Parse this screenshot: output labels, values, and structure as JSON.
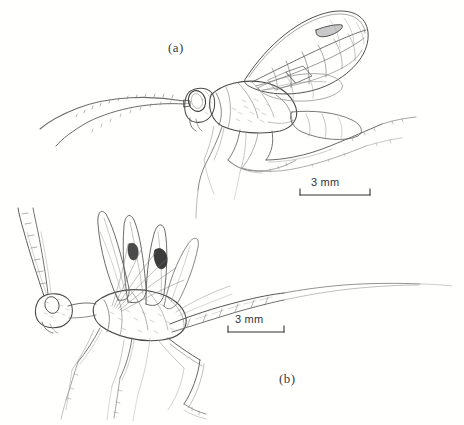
{
  "figure": {
    "type": "scientific-line-drawing",
    "background_color": "#ffffff",
    "ink_color": "#3c3c3c",
    "panels": [
      {
        "id": "a",
        "label": "(a)",
        "description": "Upper wasp, lateral view facing left, long curved antennae, large compound eye, folded forewing with venation and cells, slender legs",
        "scale_bar": {
          "label": "3 mm",
          "value": 3,
          "unit": "mm",
          "length_px": 70
        }
      },
      {
        "id": "b",
        "label": "(b)",
        "description": "Lower wasp, lateral view facing left, raised folded wings, long segmented abdomen tapering to a fine ovipositor extending right, long legs",
        "scale_bar": {
          "label": "3 mm",
          "value": 3,
          "unit": "mm",
          "length_px": 56
        }
      }
    ]
  },
  "labels": {
    "panel_a": "(a)",
    "panel_b": "(b)",
    "scale_a": "3 mm",
    "scale_b": "3 mm"
  },
  "colors": {
    "paper": "#ffffff",
    "ink_dark": "#2f2f2f",
    "ink_mid": "#585858",
    "ink_light": "#8e8e8e",
    "ink_faint": "#b4b4b4"
  }
}
